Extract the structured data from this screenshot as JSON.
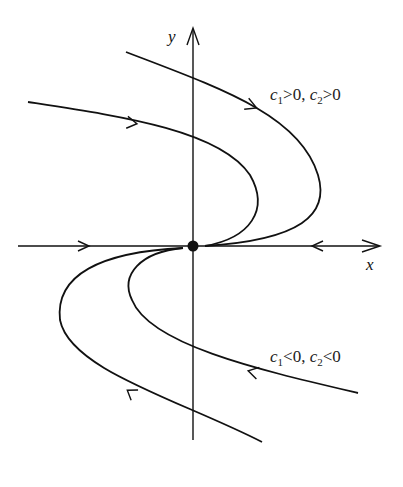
{
  "diagram": {
    "type": "phase-portrait",
    "axes": {
      "x_label": "x",
      "y_label": "y"
    },
    "equilibrium": {
      "label": "origin"
    },
    "annotations": {
      "upper": {
        "c1": "c",
        "c1_sub": "1",
        "rel1": ">0, ",
        "c2": "c",
        "c2_sub": "2",
        "rel2": ">0"
      },
      "lower": {
        "c1": "c",
        "c1_sub": "1",
        "rel1": "<0, ",
        "c2": "c",
        "c2_sub": "2",
        "rel2": "<0"
      }
    },
    "trajectories": [
      {
        "name": "upper-outer",
        "condition": "c1>0, c2>0",
        "direction": "toward origin"
      },
      {
        "name": "upper-inner",
        "condition": "c1>0, c2>0",
        "direction": "toward origin"
      },
      {
        "name": "lower-inner",
        "condition": "c1<0, c2<0",
        "direction": "away from origin"
      },
      {
        "name": "lower-outer",
        "condition": "c1<0, c2<0",
        "direction": "away from origin"
      },
      {
        "name": "negative-x-axis",
        "direction": "toward origin"
      },
      {
        "name": "positive-x-axis",
        "direction": "toward origin"
      }
    ]
  }
}
